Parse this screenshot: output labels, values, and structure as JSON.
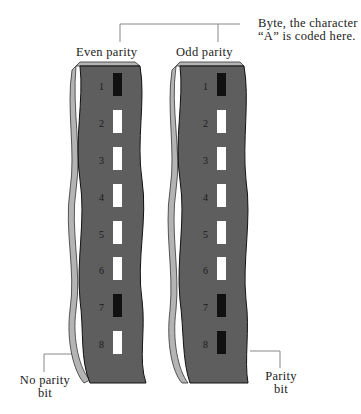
{
  "labels": {
    "byte_line1": "Byte, the character",
    "byte_line2": "“A” is coded here.",
    "even_parity": "Even parity",
    "odd_parity": "Odd parity",
    "no_parity_line1": "No parity",
    "no_parity_line2": "bit",
    "parity_line1": "Parity",
    "parity_line2": "bit"
  },
  "colors": {
    "strip_face": "#5e5e5e",
    "strip_edge": "#b4b4b4",
    "bit_on": "#111111",
    "bit_off": "#ffffff",
    "leader_line": "#888888"
  },
  "tracks": [
    "1",
    "2",
    "3",
    "4",
    "5",
    "6",
    "7",
    "8"
  ],
  "even_parity_bits": [
    1,
    0,
    0,
    0,
    0,
    0,
    1,
    0
  ],
  "odd_parity_bits": [
    1,
    0,
    0,
    0,
    0,
    0,
    1,
    1
  ]
}
